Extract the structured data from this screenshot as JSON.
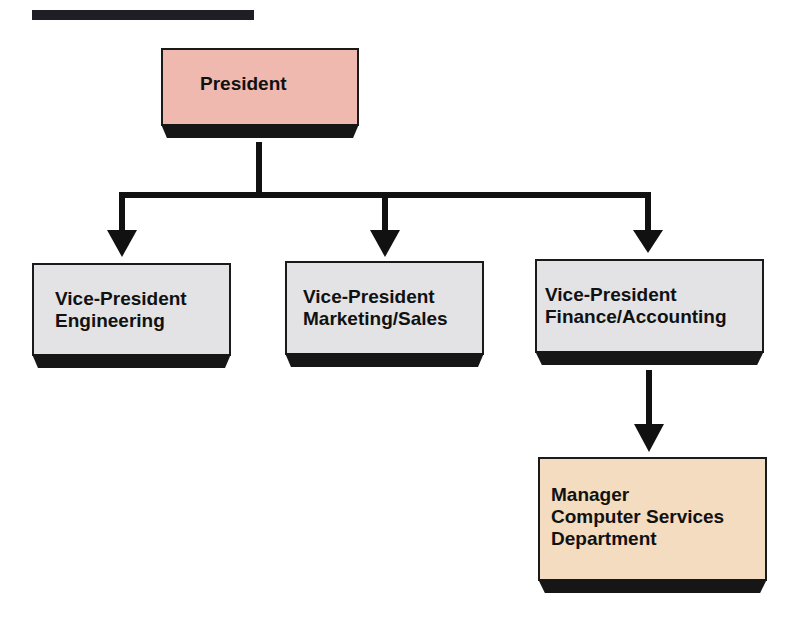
{
  "diagram": {
    "type": "org-chart",
    "colors": {
      "president_fill": "#efb9b0",
      "vp_fill": "#e3e3e5",
      "manager_fill": "#f4dcc0",
      "line": "#111111"
    },
    "nodes": {
      "president": {
        "lines": [
          "President"
        ]
      },
      "vp_engineering": {
        "lines": [
          "Vice-President",
          "Engineering"
        ]
      },
      "vp_marketing": {
        "lines": [
          "Vice-President",
          "Marketing/Sales"
        ]
      },
      "vp_finance": {
        "lines": [
          "Vice-President",
          "Finance/Accounting"
        ]
      },
      "manager_cs": {
        "lines": [
          "Manager",
          "Computer Services",
          "Department"
        ]
      }
    },
    "edges": [
      {
        "from": "President",
        "to": "Vice-President Engineering"
      },
      {
        "from": "President",
        "to": "Vice-President Marketing/Sales"
      },
      {
        "from": "President",
        "to": "Vice-President Finance/Accounting"
      },
      {
        "from": "Vice-President Finance/Accounting",
        "to": "Manager Computer Services Department"
      }
    ]
  }
}
